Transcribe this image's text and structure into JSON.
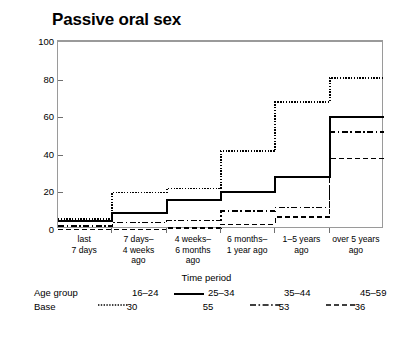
{
  "chart_data": {
    "type": "line",
    "title": "Passive oral sex",
    "xlabel": "Time period",
    "ylabel": "Cumulative percentage",
    "ylim": [
      0,
      100
    ],
    "yticks": [
      0,
      20,
      40,
      60,
      80,
      100
    ],
    "grid": false,
    "step": true,
    "legend_position": "bottom",
    "legend_title": "Age group",
    "base_label": "Base",
    "categories": [
      "last\n7 days",
      "7 days–\n4 weeks\nago",
      "4 weeks–\n6 months\nago",
      "6 months–\n1 year ago",
      "1–5 years\nago",
      "over 5 years\nago"
    ],
    "series": [
      {
        "name": "16–24",
        "base": 30,
        "style": "dotted",
        "values": [
          6,
          20,
          22,
          42,
          68,
          81
        ]
      },
      {
        "name": "25–34",
        "base": 55,
        "style": "solid",
        "values": [
          5,
          9,
          16,
          20,
          28,
          60
        ]
      },
      {
        "name": "35–44",
        "base": 53,
        "style": "dash-dot",
        "values": [
          2,
          4,
          5,
          10,
          12,
          52
        ]
      },
      {
        "name": "45–59",
        "base": 36,
        "style": "dashed",
        "values": [
          0,
          0,
          1,
          3,
          7,
          38
        ]
      }
    ]
  },
  "colors": {
    "ink": "#000000",
    "axis": "#9a9a9a",
    "tick": "#6f6f6f"
  }
}
